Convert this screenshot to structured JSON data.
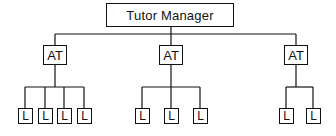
{
  "diagram": {
    "type": "hierarchy",
    "root": {
      "label": "Tutor Manager"
    },
    "agents": [
      {
        "label": "AT",
        "children": [
          "L",
          "L",
          "L",
          "L"
        ]
      },
      {
        "label": "AT",
        "children": [
          "L",
          "L",
          "L"
        ]
      },
      {
        "label": "AT",
        "children": [
          "L",
          "L"
        ]
      }
    ]
  }
}
